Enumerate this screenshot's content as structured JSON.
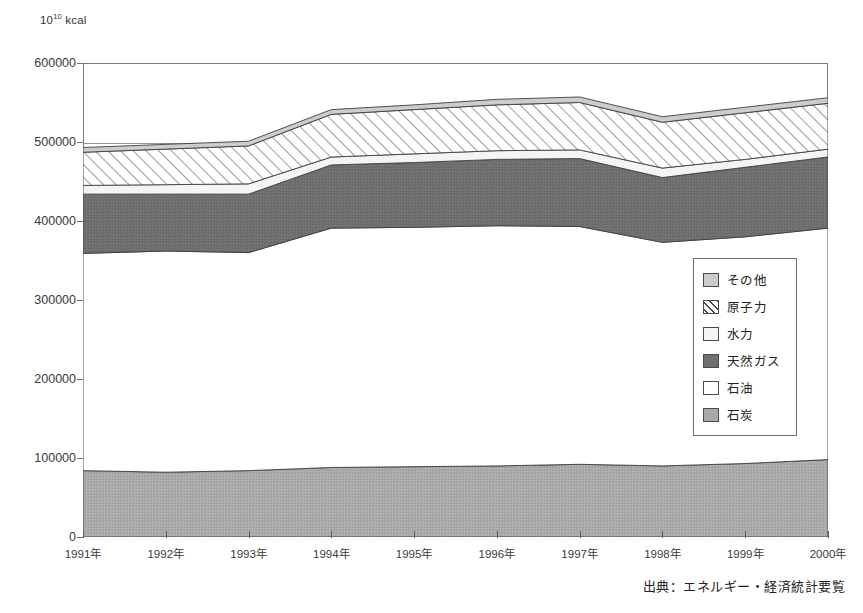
{
  "axis": {
    "unit_label_base": "10",
    "unit_label_exp": "10",
    "unit_label_suffix": " kcal",
    "y_ticks": [
      "600000",
      "500000",
      "400000",
      "300000",
      "200000",
      "100000",
      "0"
    ],
    "x_ticks": [
      "1991年",
      "1992年",
      "1993年",
      "1994年",
      "1995年",
      "1996年",
      "1997年",
      "1998年",
      "1999年",
      "2000年"
    ]
  },
  "legend": {
    "items": [
      {
        "label": "その他",
        "pattern": "solid-light-gray",
        "color": "#c9c9c9"
      },
      {
        "label": "原子力",
        "pattern": "diagonal-hatch",
        "color": "#ffffff"
      },
      {
        "label": "水力",
        "pattern": "solid-near-white",
        "color": "#f2f2f2"
      },
      {
        "label": "天然ガス",
        "pattern": "solid-dark-gray",
        "color": "#6e6e6e"
      },
      {
        "label": "石油",
        "pattern": "solid-white",
        "color": "#ffffff"
      },
      {
        "label": "石炭",
        "pattern": "solid-medium-gray",
        "color": "#a8a8a8"
      }
    ]
  },
  "source": {
    "text": "出典：エネルギー・経済統計要覧"
  },
  "chart_data": {
    "type": "area",
    "stacked": true,
    "title": "",
    "xlabel": "",
    "ylabel": "10^10 kcal",
    "ylim": [
      0,
      600000
    ],
    "ytick_step": 100000,
    "grid": true,
    "legend_position": "inside-right",
    "categories": [
      "1991年",
      "1992年",
      "1993年",
      "1994年",
      "1995年",
      "1996年",
      "1997年",
      "1998年",
      "1999年",
      "2000年"
    ],
    "series": [
      {
        "name": "石炭",
        "color": "#a8a8a8",
        "pattern": "solid-medium-gray",
        "values": [
          84000,
          82000,
          84000,
          88000,
          89000,
          90000,
          92000,
          90000,
          93000,
          98000
        ]
      },
      {
        "name": "石油",
        "color": "#ffffff",
        "pattern": "solid-white",
        "values": [
          275000,
          280000,
          276000,
          303000,
          303000,
          304000,
          301000,
          283000,
          287000,
          293000
        ]
      },
      {
        "name": "天然ガス",
        "color": "#6e6e6e",
        "pattern": "solid-dark-gray",
        "values": [
          75000,
          72000,
          74000,
          80000,
          82000,
          84000,
          86000,
          82000,
          88000,
          90000
        ]
      },
      {
        "name": "水力",
        "color": "#f2f2f2",
        "pattern": "solid-near-white",
        "values": [
          11000,
          12000,
          13000,
          10000,
          11000,
          11000,
          11000,
          12000,
          10000,
          10000
        ]
      },
      {
        "name": "原子力",
        "color": "#ffffff",
        "pattern": "diagonal-hatch",
        "values": [
          42000,
          45000,
          48000,
          54000,
          56000,
          58000,
          60000,
          58000,
          59000,
          58000
        ]
      },
      {
        "name": "その他",
        "color": "#c9c9c9",
        "pattern": "solid-light-gray",
        "values": [
          6000,
          6000,
          6000,
          6000,
          6000,
          7000,
          7000,
          7000,
          7000,
          7000
        ]
      }
    ],
    "totals": [
      493000,
      497000,
      501000,
      541000,
      547000,
      554000,
      557000,
      532000,
      544000,
      556000
    ]
  }
}
